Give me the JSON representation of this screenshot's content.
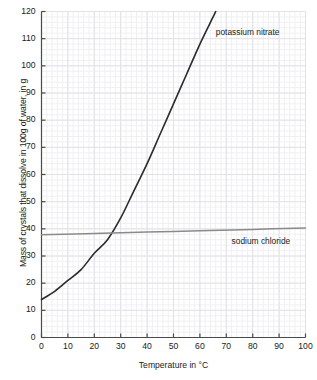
{
  "chart_data": {
    "type": "line",
    "title": "",
    "xlabel": "Temperature in °C",
    "ylabel": "Mass of crystals that dissolve in 100g of water, in g",
    "xlim": [
      0,
      100
    ],
    "ylim": [
      0,
      120
    ],
    "xticks": [
      0,
      10,
      20,
      30,
      40,
      50,
      60,
      70,
      80,
      90,
      100
    ],
    "yticks": [
      0,
      10,
      20,
      30,
      40,
      50,
      60,
      70,
      80,
      90,
      100,
      110,
      120
    ],
    "xtick_labels": [
      "0",
      "10",
      "20",
      "30",
      "40",
      "50",
      "60",
      "70",
      "80",
      "90",
      "100"
    ],
    "ytick_labels": [
      "0",
      "10",
      "20",
      "30",
      "40",
      "50",
      "60",
      "70",
      "80",
      "90",
      "100",
      "110",
      "120"
    ],
    "grid": true,
    "minor_grid_step_x": 2,
    "minor_grid_step_y": 2,
    "legend": "inline-annotations",
    "series": [
      {
        "name": "potassium nitrate",
        "color": "#2b2b2b",
        "label_x": 66,
        "label_y": 112,
        "x": [
          0,
          5,
          10,
          15,
          20,
          25,
          30,
          35,
          40,
          45,
          50,
          55,
          60,
          65,
          66
        ],
        "values": [
          14,
          17,
          21,
          25,
          31,
          36,
          44,
          54,
          64,
          75,
          86,
          97,
          108,
          118,
          120
        ]
      },
      {
        "name": "sodium chloride",
        "color": "#8a8a8a",
        "label_x": 72,
        "label_y": 35,
        "x": [
          0,
          20,
          40,
          60,
          80,
          100
        ],
        "values": [
          37.8,
          38.3,
          38.8,
          39.3,
          39.8,
          40.3
        ]
      }
    ],
    "annotations": [
      {
        "text": "potassium nitrate",
        "x": 66,
        "y": 112
      },
      {
        "text": "sodium chloride",
        "x": 72,
        "y": 35
      }
    ]
  }
}
